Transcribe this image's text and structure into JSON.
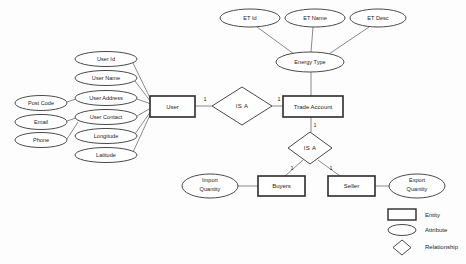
{
  "diagram": {
    "entities": [
      {
        "id": "user",
        "label": "User",
        "x": 150,
        "y": 96,
        "w": 45,
        "h": 21
      },
      {
        "id": "trade_account",
        "label": "Trade Account",
        "x": 283,
        "y": 96,
        "w": 60,
        "h": 21
      },
      {
        "id": "buyers",
        "label": "Buyers",
        "x": 258,
        "y": 176,
        "w": 47,
        "h": 20
      },
      {
        "id": "seller",
        "label": "Seller",
        "x": 328,
        "y": 176,
        "w": 47,
        "h": 20
      }
    ],
    "attributes": [
      {
        "id": "user_id",
        "label": "User Id",
        "cx": 106,
        "cy": 59,
        "rx": 31,
        "ry": 7.5
      },
      {
        "id": "user_name",
        "label": "User Name",
        "cx": 106,
        "cy": 78,
        "rx": 31,
        "ry": 7.5
      },
      {
        "id": "user_address",
        "label": "User Address",
        "cx": 106,
        "cy": 98,
        "rx": 31,
        "ry": 7.5
      },
      {
        "id": "user_contact",
        "label": "User Contact",
        "cx": 106,
        "cy": 117,
        "rx": 31,
        "ry": 7.5
      },
      {
        "id": "longitude",
        "label": "Longitude",
        "cx": 106,
        "cy": 136,
        "rx": 31,
        "ry": 7.5
      },
      {
        "id": "latitude",
        "label": "Latitude",
        "cx": 106,
        "cy": 155,
        "rx": 31,
        "ry": 7.5
      },
      {
        "id": "post_code",
        "label": "Post Code",
        "cx": 41,
        "cy": 103,
        "rx": 26,
        "ry": 7.5
      },
      {
        "id": "email",
        "label": "Email",
        "cx": 41,
        "cy": 122,
        "rx": 26,
        "ry": 7.5
      },
      {
        "id": "phone",
        "label": "Phone",
        "cx": 41,
        "cy": 140,
        "rx": 26,
        "ry": 7.5
      },
      {
        "id": "et_id",
        "label": "ET Id",
        "cx": 250,
        "cy": 18,
        "rx": 30,
        "ry": 9
      },
      {
        "id": "et_name",
        "label": "ET Name",
        "cx": 315,
        "cy": 18,
        "rx": 30,
        "ry": 9
      },
      {
        "id": "et_desc",
        "label": "ET Desc",
        "cx": 378,
        "cy": 18,
        "rx": 28,
        "ry": 9
      },
      {
        "id": "energy_type",
        "label": "Energy Type",
        "cx": 310,
        "cy": 62,
        "rx": 34,
        "ry": 10
      }
    ],
    "multiline_attributes": [
      {
        "id": "import_quantity",
        "line1": "Import",
        "line2": "Quantity",
        "cx": 210,
        "cy": 186,
        "rx": 28,
        "ry": 12
      },
      {
        "id": "export_quantity",
        "line1": "Export",
        "line2": "Quantity",
        "cx": 417,
        "cy": 186,
        "rx": 28,
        "ry": 12
      }
    ],
    "relationships": [
      {
        "id": "is_a_user_trade",
        "label": "IS A",
        "cx": 242,
        "cy": 106,
        "rx": 30,
        "ry": 19
      },
      {
        "id": "is_a_buyer_seller",
        "label": "IS A",
        "cx": 310,
        "cy": 148,
        "rx": 22,
        "ry": 16
      }
    ],
    "cardinalities": [
      {
        "id": "card-user-isa",
        "value": "1",
        "x": 205,
        "y": 101
      },
      {
        "id": "card-isa-trade",
        "value": "1",
        "x": 279,
        "y": 101
      },
      {
        "id": "card-trade-isa2",
        "value": "1",
        "x": 315,
        "y": 127
      },
      {
        "id": "card-isa2-buyers",
        "value": "1",
        "x": 292,
        "y": 170
      },
      {
        "id": "card-isa2-seller",
        "value": "1",
        "x": 331,
        "y": 170
      }
    ],
    "legend": {
      "items": [
        {
          "id": "legend-entity",
          "shape": "rectangle",
          "label": "Entity"
        },
        {
          "id": "legend-attribute",
          "shape": "ellipse",
          "label": "Attribute"
        },
        {
          "id": "legend-relationship",
          "shape": "diamond",
          "label": "Relationship"
        }
      ]
    },
    "colors": {
      "entity_stroke": "#2b2b2b",
      "attribute_stroke": "#4a4a4a",
      "relationship_stroke": "#4a4a4a",
      "connector": "#7d7d7d",
      "text": "#1c1c1c",
      "background": "#fdfdfd"
    }
  }
}
